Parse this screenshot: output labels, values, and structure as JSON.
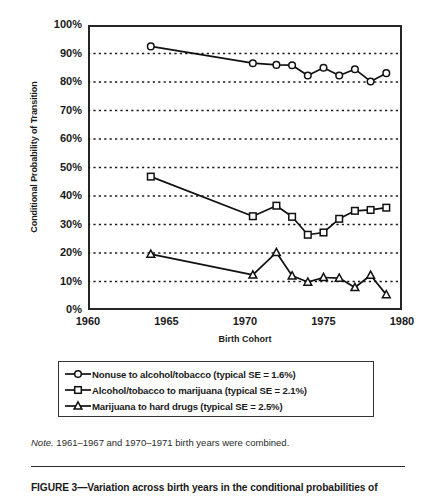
{
  "figure": {
    "note_prefix": "Note.",
    "note_text": " 1961–1967 and 1970–1971 birth years were combined.",
    "caption": "FIGURE 3—Variation across birth years in the conditional probabilities of"
  },
  "legend": {
    "items": [
      {
        "marker": "circle-open-marker",
        "label": "Nonuse to alcohol/tobacco (typical SE = 1.6%)"
      },
      {
        "marker": "square-open-marker",
        "label": "Alcohol/tobacco to marijuana (typical SE = 2.1%)"
      },
      {
        "marker": "triangle-open-marker",
        "label": "Marijuana to hard drugs (typical SE = 2.5%)"
      }
    ]
  },
  "chart_data": {
    "type": "line",
    "title": "",
    "xlabel": "Birth Cohort",
    "ylabel": "Conditional Probability of Transition",
    "xlim": [
      1960,
      1980
    ],
    "ylim": [
      0,
      100
    ],
    "xticks": [
      1960,
      1965,
      1970,
      1975,
      1980
    ],
    "xtick_labels": [
      "1960",
      "1965",
      "1970",
      "1975",
      "1980"
    ],
    "x_minor_tick_step": 1,
    "yticks": [
      0,
      10,
      20,
      30,
      40,
      50,
      60,
      70,
      80,
      90,
      100
    ],
    "ytick_labels": [
      "0%",
      "10%",
      "20%",
      "30%",
      "40%",
      "50%",
      "60%",
      "70%",
      "80%",
      "90%",
      "100%"
    ],
    "grid": "horizontal-dotted",
    "legend_position": "below-plot",
    "series": [
      {
        "name": "Nonuse to alcohol/tobacco (typical SE = 1.6%)",
        "marker": "circle-open-marker",
        "x": [
          1964,
          1970.5,
          1972,
          1973,
          1974,
          1975,
          1976,
          1977,
          1978,
          1979
        ],
        "values": [
          92.5,
          86.6,
          86.0,
          85.9,
          82.3,
          85.0,
          82.3,
          84.5,
          80.2,
          83.1
        ]
      },
      {
        "name": "Alcohol/tobacco to marijuana (typical SE = 2.1%)",
        "marker": "square-open-marker",
        "x": [
          1964,
          1970.5,
          1972,
          1973,
          1974,
          1975,
          1976,
          1977,
          1978,
          1979
        ],
        "values": [
          46.8,
          32.9,
          36.6,
          32.7,
          26.4,
          27.2,
          32.0,
          34.8,
          35.1,
          35.9
        ]
      },
      {
        "name": "Marijuana to hard drugs (typical SE = 2.5%)",
        "marker": "triangle-open-marker",
        "x": [
          1964,
          1970.5,
          1972,
          1973,
          1974,
          1975,
          1976,
          1977,
          1978,
          1979
        ],
        "values": [
          19.6,
          12.3,
          20.2,
          12.0,
          9.8,
          11.4,
          11.2,
          7.9,
          12.2,
          5.4
        ]
      }
    ]
  }
}
